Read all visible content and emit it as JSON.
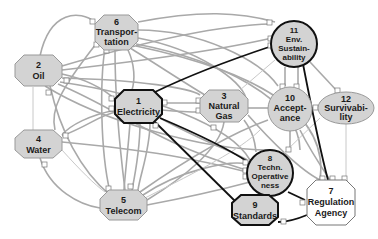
{
  "diagram": {
    "type": "interdependency-network",
    "nodes": [
      {
        "id": "1",
        "number": "1",
        "lines": [
          "Electricity"
        ],
        "shape": "octagon",
        "fill": "#d3d3d3",
        "bold_border": true
      },
      {
        "id": "2",
        "number": "2",
        "lines": [
          "Oil"
        ],
        "shape": "octagon",
        "fill": "#d3d3d3",
        "bold_border": false
      },
      {
        "id": "3",
        "number": "3",
        "lines": [
          "Natural",
          "Gas"
        ],
        "shape": "octagon",
        "fill": "#d3d3d3",
        "bold_border": false
      },
      {
        "id": "4",
        "number": "4",
        "lines": [
          "Water"
        ],
        "shape": "octagon",
        "fill": "#d3d3d3",
        "bold_border": false
      },
      {
        "id": "5",
        "number": "5",
        "lines": [
          "Telecom"
        ],
        "shape": "octagon",
        "fill": "#d3d3d3",
        "bold_border": false
      },
      {
        "id": "6",
        "number": "6",
        "lines": [
          "Transpor-",
          "tation"
        ],
        "shape": "octagon",
        "fill": "#d3d3d3",
        "bold_border": false
      },
      {
        "id": "7",
        "number": "7",
        "lines": [
          "Regulation",
          "Agency"
        ],
        "shape": "octagon",
        "fill": "#ffffff",
        "bold_border": false
      },
      {
        "id": "8",
        "number": "8",
        "lines": [
          "Techn.",
          "Operative",
          "ness"
        ],
        "shape": "circle",
        "fill": "#d3d3d3",
        "bold_border": true
      },
      {
        "id": "9",
        "number": "9",
        "lines": [
          "Standards"
        ],
        "shape": "octagon",
        "fill": "#d3d3d3",
        "bold_border": true
      },
      {
        "id": "10",
        "number": "10",
        "lines": [
          "Accept-",
          "ance"
        ],
        "shape": "ellipse",
        "fill": "#d3d3d3",
        "bold_border": false
      },
      {
        "id": "11",
        "number": "11",
        "lines": [
          "Env.",
          "Sustain-",
          "ability"
        ],
        "shape": "circle",
        "fill": "#d3d3d3",
        "bold_border": true
      },
      {
        "id": "12",
        "number": "12",
        "lines": [
          "Survivabi-",
          "lity"
        ],
        "shape": "ellipse",
        "fill": "#d3d3d3",
        "bold_border": false
      }
    ],
    "dark_edges": [
      {
        "from": "1",
        "to": "11"
      },
      {
        "from": "1",
        "to": "8"
      },
      {
        "from": "1",
        "to": "9"
      },
      {
        "from": "11",
        "to": "7"
      },
      {
        "from": "8",
        "to": "7"
      },
      {
        "from": "7",
        "to": "9"
      }
    ],
    "colors": {
      "node_fill": "#d3d3d3",
      "node_fill_alt": "#ffffff",
      "edge_gray": "#a9a9a9",
      "edge_dark": "#111111"
    }
  }
}
